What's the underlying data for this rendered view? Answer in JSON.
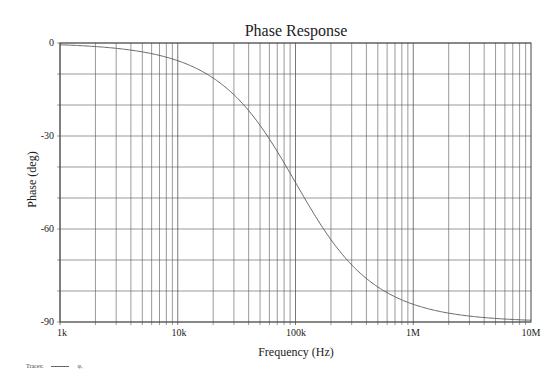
{
  "chart_data": {
    "type": "line",
    "title": "Phase Response",
    "xlabel": "Frequency (Hz)",
    "ylabel": "Phase (deg)",
    "x_scale": "log",
    "xlim": [
      1000,
      10000000
    ],
    "ylim": [
      -90,
      0
    ],
    "x_tick_labels": [
      "1k",
      "10k",
      "100k",
      "1M",
      "10M"
    ],
    "x_tick_values": [
      1000,
      10000,
      100000,
      1000000,
      10000000
    ],
    "y_tick_labels": [
      "0",
      "-30",
      "-60",
      "-90"
    ],
    "y_tick_values": [
      0,
      -30,
      -60,
      -90
    ],
    "y_grid_step": 10,
    "grid": true,
    "legend_position": "bottom-left",
    "legend": {
      "prefix": "Traces:",
      "entries": [
        "φ,"
      ]
    },
    "series": [
      {
        "name": "φ",
        "model": "first-order low-pass, fc = 100 kHz",
        "corner_frequency_hz": 100000,
        "x": [
          1000,
          2000,
          5000,
          10000,
          20000,
          50000,
          100000,
          200000,
          500000,
          1000000,
          2000000,
          5000000,
          10000000
        ],
        "values": [
          -0.57,
          -1.15,
          -2.86,
          -5.71,
          -11.31,
          -26.57,
          -45.0,
          -63.43,
          -78.69,
          -84.29,
          -87.14,
          -88.85,
          -89.43
        ]
      }
    ]
  },
  "colors": {
    "grid": "#555555",
    "trace": "#555555",
    "background": "#ffffff",
    "text": "#222222"
  }
}
